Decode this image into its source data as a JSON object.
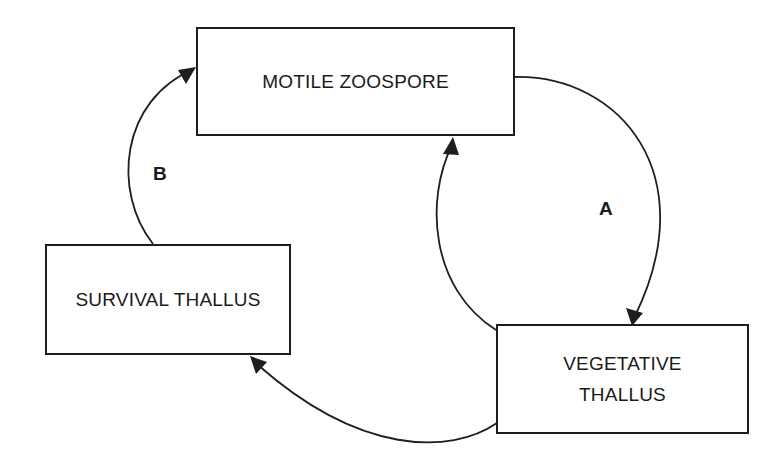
{
  "diagram": {
    "type": "life-cycle",
    "nodes": {
      "motile_zoospore": {
        "label": "MOTILE ZOOSPORE"
      },
      "survival_thallus": {
        "label": "SURVIVAL THALLUS"
      },
      "vegetative_thallus": {
        "line1": "VEGETATIVE",
        "line2": "THALLUS"
      }
    },
    "edges": [
      {
        "id": "A",
        "from": "MOTILE ZOOSPORE",
        "to": "VEGETATIVE THALLUS",
        "label": "A"
      },
      {
        "id": "return",
        "from": "VEGETATIVE THALLUS",
        "to": "MOTILE ZOOSPORE",
        "label": ""
      },
      {
        "id": "to-survival",
        "from": "VEGETATIVE THALLUS",
        "to": "SURVIVAL THALLUS",
        "label": ""
      },
      {
        "id": "B",
        "from": "SURVIVAL THALLUS",
        "to": "MOTILE ZOOSPORE",
        "label": "B"
      }
    ],
    "labels": {
      "a": "A",
      "b": "B"
    },
    "colors": {
      "line": "#1e1e1e",
      "background": "#ffffff"
    }
  }
}
